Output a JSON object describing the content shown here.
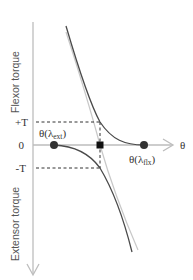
{
  "diagram": {
    "y_axis": {
      "positive_label": "Flexor torque",
      "negative_label": "Extensor torque"
    },
    "x_axis": {
      "label": "θ"
    },
    "ticks": {
      "plus_t": "+T",
      "zero": "0",
      "minus_t": "-T"
    },
    "points": {
      "ext": {
        "prefix": "θ(λ",
        "sub": "ext",
        "suffix": ")"
      },
      "flx": {
        "prefix": "θ(λ",
        "sub": "flx",
        "suffix": ")"
      }
    },
    "colors": {
      "curve_dark": "#4a4a4a",
      "curve_light": "#c8c8c8",
      "axis": "#bdbdbd",
      "dashed": "#333333",
      "marker": "#222222"
    }
  }
}
